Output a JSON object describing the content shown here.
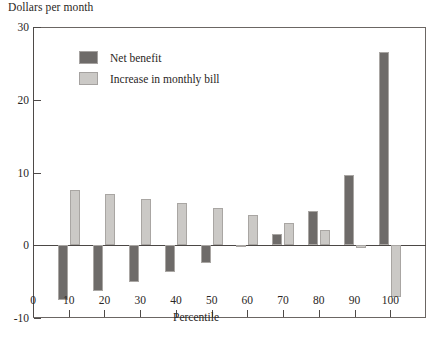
{
  "chart_data": {
    "type": "bar",
    "title": "",
    "ylabel": "Dollars per month",
    "xlabel": "Percentile",
    "categories": [
      "10",
      "20",
      "30",
      "40",
      "50",
      "60",
      "70",
      "80",
      "90",
      "100"
    ],
    "x": [
      10,
      20,
      30,
      40,
      50,
      60,
      70,
      80,
      90,
      100
    ],
    "series": [
      {
        "name": "Net benefit",
        "color": "#6e6b69",
        "values": [
          -7.5,
          -6.3,
          -5.0,
          -3.7,
          -2.5,
          -0.3,
          1.6,
          4.7,
          9.7,
          26.6
        ]
      },
      {
        "name": "Increase in monthly bill",
        "color": "#cbc9c6",
        "values": [
          7.6,
          7.1,
          6.4,
          5.8,
          5.1,
          4.2,
          3.1,
          2.1,
          -0.4,
          -7.1
        ]
      }
    ],
    "ylim": [
      -10,
      30
    ],
    "yticks": [
      -10,
      0,
      10,
      20,
      30
    ],
    "ytick_labels": [
      "-10",
      "0",
      "10",
      "20",
      "30"
    ],
    "xlim": [
      0,
      110
    ],
    "xticks": [
      0,
      10,
      20,
      30,
      40,
      50,
      60,
      70,
      80,
      90,
      100
    ],
    "xtick_labels": [
      "0",
      "10",
      "20",
      "30",
      "40",
      "50",
      "60",
      "70",
      "80",
      "90",
      "100"
    ],
    "grid": false,
    "legend_position": "upper-left-inside",
    "legend": [
      {
        "label": "Net benefit",
        "color": "#6e6b69"
      },
      {
        "label": "Increase in monthly bill",
        "color": "#cbc9c6"
      }
    ]
  }
}
